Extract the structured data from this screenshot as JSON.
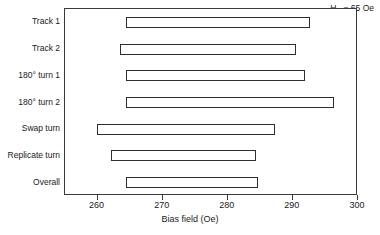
{
  "chart_data": {
    "type": "bar",
    "orientation": "horizontal",
    "title": "",
    "xlabel": "Bias field (Oe)",
    "ylabel": "",
    "xlim": [
      255,
      300
    ],
    "xticks": [
      260,
      270,
      280,
      290,
      300
    ],
    "xtick_labels": [
      "260",
      "270",
      "280",
      "290",
      "300"
    ],
    "grid": false,
    "legend": null,
    "annotations": [
      {
        "text_prefix": "H",
        "text_sub": "D",
        "text_suffix": " = 65 Oe",
        "full_text": "HD = 65 Oe",
        "position": "top-right"
      }
    ],
    "categories": [
      "Track 1",
      "Track 2",
      "180° turn 1",
      "180° turn 2",
      "Swap turn",
      "Replicate turn",
      "Overall"
    ],
    "bars": [
      {
        "label": "Track 1",
        "start": 264.3,
        "end": 292.7,
        "width": 28.4
      },
      {
        "label": "Track 2",
        "start": 263.4,
        "end": 290.5,
        "width": 27.1
      },
      {
        "label": "180° turn 1",
        "start": 264.3,
        "end": 291.8,
        "width": 27.5
      },
      {
        "label": "180° turn 2",
        "start": 264.3,
        "end": 296.3,
        "width": 32.0
      },
      {
        "label": "Swap turn",
        "start": 259.9,
        "end": 287.2,
        "width": 27.3
      },
      {
        "label": "Replicate turn",
        "start": 262.1,
        "end": 284.4,
        "width": 22.3
      },
      {
        "label": "Overall",
        "start": 264.3,
        "end": 284.6,
        "width": 20.3
      }
    ],
    "colors": {
      "bar_fill": "#ffffff",
      "bar_stroke": "#2e2e2e",
      "axis": "#3a3a3a",
      "text": "#1a1a1a",
      "background": "#ffffff"
    }
  }
}
